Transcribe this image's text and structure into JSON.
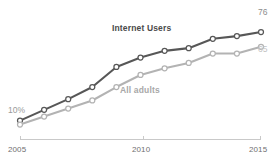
{
  "chart_data": {
    "type": "line",
    "title": "",
    "subtitle": "",
    "xlabel": "",
    "ylabel": "",
    "x": [
      2005,
      2006,
      2007,
      2008,
      2009,
      2010,
      2011,
      2012,
      2013,
      2014,
      2015
    ],
    "xlim": [
      2005,
      2015
    ],
    "ylim": [
      0,
      85
    ],
    "grid": false,
    "legend_position": "inline-annotations",
    "tick_labels_x": [
      "2005",
      "2010",
      "2015"
    ],
    "tick_values_x": [
      2005,
      2010,
      2015
    ],
    "series": [
      {
        "name": "Internet Users",
        "color": "#575757",
        "marker": "open-circle",
        "values": [
          10,
          18,
          26,
          35,
          50,
          57,
          62,
          64,
          71,
          73,
          76
        ],
        "start_label": "10%",
        "end_label": "76"
      },
      {
        "name": "All adults",
        "color": "#b3b3b3",
        "marker": "open-circle",
        "values": [
          7,
          13,
          19,
          25,
          35,
          44,
          49,
          53,
          60,
          60,
          65
        ],
        "start_label": "",
        "end_label": "65"
      }
    ],
    "annotations": [
      {
        "text": "Internet Users",
        "role": "series-label",
        "series": "Internet Users"
      },
      {
        "text": "All adults",
        "role": "series-label",
        "series": "All adults"
      },
      {
        "text": "10%",
        "role": "start-value",
        "series": "Internet Users"
      },
      {
        "text": "76",
        "role": "end-value",
        "series": "Internet Users"
      },
      {
        "text": "65",
        "role": "end-value",
        "series": "All adults"
      }
    ]
  },
  "labels": {
    "series_internet": "Internet Users",
    "series_all_adults": "All adults",
    "start_value_internet": "10%",
    "end_value_internet": "76",
    "end_value_all_adults": "65",
    "tick_2005": "2005",
    "tick_2010": "2010",
    "tick_2015": "2015"
  },
  "colors": {
    "dark_series": "#575757",
    "light_series": "#b3b3b3",
    "axis": "#c9c9c9",
    "background": "#ffffff"
  }
}
